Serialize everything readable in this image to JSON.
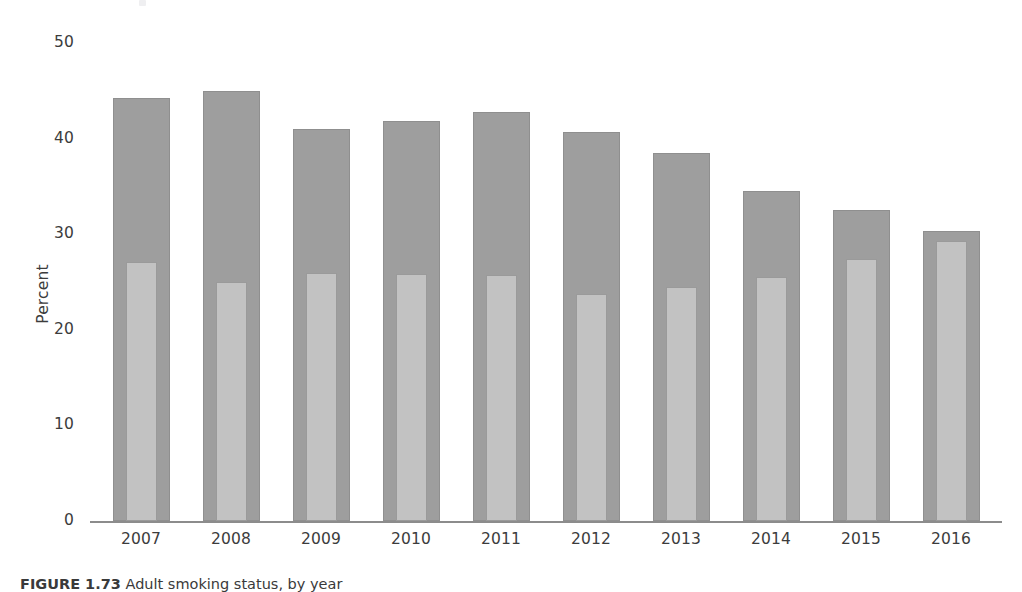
{
  "figure": {
    "caption_label": "FIGURE 1.73",
    "caption_text": "Adult smoking status, by year"
  },
  "chart_data": {
    "type": "bar",
    "title": "",
    "subtitle": "",
    "xlabel": "",
    "ylabel": "Percent",
    "ylim": [
      0,
      50
    ],
    "yticks": [
      0,
      10,
      20,
      30,
      40,
      50
    ],
    "ytick_labels": [
      "0",
      "10",
      "20",
      "30",
      "40",
      "50"
    ],
    "grid": false,
    "legend": "none",
    "categories": [
      "2007",
      "2008",
      "2009",
      "2010",
      "2011",
      "2012",
      "2013",
      "2014",
      "2015",
      "2016"
    ],
    "series": [
      {
        "name": "Total",
        "color": "#9e9e9e",
        "values": [
          44.2,
          45.0,
          41.0,
          41.8,
          42.8,
          40.7,
          38.5,
          34.5,
          32.5,
          30.3
        ]
      },
      {
        "name": "Subgroup",
        "color": "#c2c2c2",
        "values": [
          27.1,
          25.0,
          25.9,
          25.8,
          25.7,
          23.7,
          24.5,
          25.5,
          27.4,
          29.3
        ]
      }
    ]
  }
}
